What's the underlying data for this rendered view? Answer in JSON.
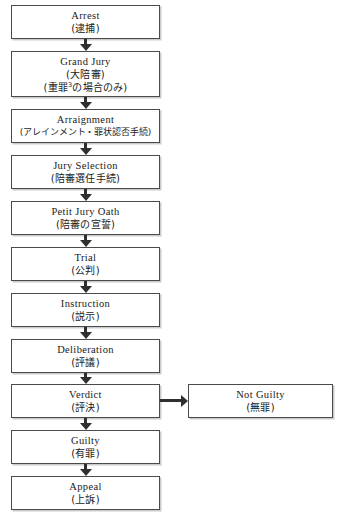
{
  "diagram": {
    "type": "flowchart",
    "orientation": "vertical",
    "colors": {
      "background": "#ffffff",
      "box_border": "#4a4a4a",
      "box_fill": "#ffffff",
      "arrow": "#2f2f2f",
      "text": "#1a1a1a"
    },
    "nodes": [
      {
        "id": "arrest",
        "en": "Arrest",
        "jp": "(逮捕)"
      },
      {
        "id": "grand-jury",
        "en": "Grand Jury",
        "jp": "(大陪審)",
        "jp2_pre": "(重罪",
        "jp2_sup": "3",
        "jp2_post": "の場合のみ)"
      },
      {
        "id": "arraignment",
        "en": "Arraignment",
        "jp": "(アレインメント・罪状認否手続)"
      },
      {
        "id": "jury-selection",
        "en": "Jury Selection",
        "jp": "(陪審選任手続)"
      },
      {
        "id": "petit-jury-oath",
        "en": "Petit Jury Oath",
        "jp": "(陪審の宣誓)"
      },
      {
        "id": "trial",
        "en": "Trial",
        "jp": "(公判)"
      },
      {
        "id": "instruction",
        "en": "Instruction",
        "jp": "(説示)"
      },
      {
        "id": "deliberation",
        "en": "Deliberation",
        "jp": "(評議)"
      },
      {
        "id": "verdict",
        "en": "Verdict",
        "jp": "(評決)"
      },
      {
        "id": "guilty",
        "en": "Guilty",
        "jp": "(有罪)"
      },
      {
        "id": "appeal",
        "en": "Appeal",
        "jp": "(上訴)"
      },
      {
        "id": "not-guilty",
        "en": "Not Guilty",
        "jp": "(無罪)"
      }
    ],
    "edges": [
      {
        "from": "arrest",
        "to": "grand-jury",
        "direction": "down"
      },
      {
        "from": "grand-jury",
        "to": "arraignment",
        "direction": "down"
      },
      {
        "from": "arraignment",
        "to": "jury-selection",
        "direction": "down"
      },
      {
        "from": "jury-selection",
        "to": "petit-jury-oath",
        "direction": "down"
      },
      {
        "from": "petit-jury-oath",
        "to": "trial",
        "direction": "down"
      },
      {
        "from": "trial",
        "to": "instruction",
        "direction": "down"
      },
      {
        "from": "instruction",
        "to": "deliberation",
        "direction": "down"
      },
      {
        "from": "deliberation",
        "to": "verdict",
        "direction": "down"
      },
      {
        "from": "verdict",
        "to": "not-guilty",
        "direction": "right"
      },
      {
        "from": "verdict",
        "to": "guilty",
        "direction": "down"
      },
      {
        "from": "guilty",
        "to": "appeal",
        "direction": "down"
      }
    ]
  }
}
